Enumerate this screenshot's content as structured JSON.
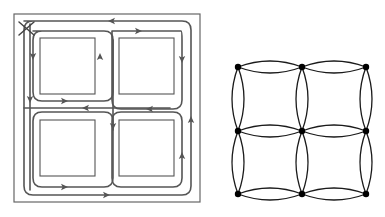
{
  "figure": {
    "background_color": "#ffffff",
    "stroke_color": "#555555",
    "frame_color": "#666666",
    "node_color": "#000000",
    "lattice_stroke_color": "#1a1a1a",
    "panel_count": 2
  },
  "left_panel": {
    "name": "routing-tour-diagram",
    "caption": "",
    "frame": {
      "label": "outer-boundary",
      "x": 14,
      "y": 14,
      "width": 186,
      "height": 188,
      "stroke": "#666666",
      "stroke_width": 1.2
    },
    "start_marker": {
      "label": "X",
      "name": "start-marker-x",
      "x": 25,
      "y": 28,
      "size": 9,
      "stroke": "#444444"
    },
    "blocks": [
      {
        "id": "block-top-left",
        "x": 40,
        "y": 38,
        "width": 55,
        "height": 56
      },
      {
        "id": "block-top-right",
        "x": 119,
        "y": 38,
        "width": 55,
        "height": 56
      },
      {
        "id": "block-bottom-left",
        "x": 40,
        "y": 120,
        "width": 55,
        "height": 56
      },
      {
        "id": "block-bottom-right",
        "x": 119,
        "y": 120,
        "width": 55,
        "height": 56
      }
    ],
    "path_color": "#555555",
    "path_width": 1.6,
    "corner_radius": 9,
    "arrow_count": 14,
    "arrow_directions": [
      "left",
      "right",
      "down",
      "down",
      "up",
      "down",
      "right",
      "left",
      "left",
      "up",
      "down",
      "up",
      "right",
      "up"
    ]
  },
  "right_panel": {
    "name": "lens-lattice-graph",
    "caption": "",
    "node_rows": 3,
    "node_cols": 3,
    "node_radius": 3.2,
    "edge_stroke": "#1a1a1a",
    "edge_width": 1.3,
    "lens_bulge": 12,
    "nodes": [
      {
        "id": "n00",
        "x": 238,
        "y": 67
      },
      {
        "id": "n01",
        "x": 302,
        "y": 67
      },
      {
        "id": "n02",
        "x": 366,
        "y": 67
      },
      {
        "id": "n10",
        "x": 238,
        "y": 131
      },
      {
        "id": "n11",
        "x": 302,
        "y": 131
      },
      {
        "id": "n12",
        "x": 366,
        "y": 131
      },
      {
        "id": "n20",
        "x": 238,
        "y": 194
      },
      {
        "id": "n21",
        "x": 302,
        "y": 194
      },
      {
        "id": "n22",
        "x": 366,
        "y": 194
      }
    ],
    "edges": [
      {
        "from": "n00",
        "to": "n01",
        "type": "lens",
        "orientation": "horizontal"
      },
      {
        "from": "n01",
        "to": "n02",
        "type": "lens",
        "orientation": "horizontal"
      },
      {
        "from": "n10",
        "to": "n11",
        "type": "lens",
        "orientation": "horizontal"
      },
      {
        "from": "n11",
        "to": "n12",
        "type": "lens",
        "orientation": "horizontal"
      },
      {
        "from": "n20",
        "to": "n21",
        "type": "lens",
        "orientation": "horizontal"
      },
      {
        "from": "n21",
        "to": "n22",
        "type": "lens",
        "orientation": "horizontal"
      },
      {
        "from": "n00",
        "to": "n10",
        "type": "lens",
        "orientation": "vertical"
      },
      {
        "from": "n10",
        "to": "n20",
        "type": "lens",
        "orientation": "vertical"
      },
      {
        "from": "n01",
        "to": "n11",
        "type": "lens",
        "orientation": "vertical"
      },
      {
        "from": "n11",
        "to": "n21",
        "type": "lens",
        "orientation": "vertical"
      },
      {
        "from": "n02",
        "to": "n12",
        "type": "lens",
        "orientation": "vertical"
      },
      {
        "from": "n12",
        "to": "n22",
        "type": "lens",
        "orientation": "vertical"
      }
    ]
  }
}
